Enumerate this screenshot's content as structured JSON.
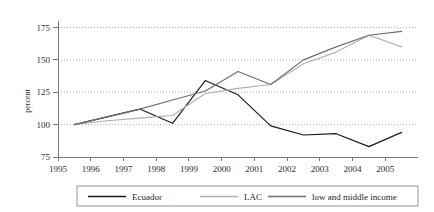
{
  "chart_data": {
    "type": "line",
    "title": "",
    "subtitle": "",
    "xlabel": "",
    "ylabel": "percent",
    "xlim": [
      1995,
      2006
    ],
    "ylim": [
      75,
      180
    ],
    "yticks": [
      75,
      100,
      125,
      150,
      175
    ],
    "xticks": [
      1995,
      1996,
      1997,
      1998,
      1999,
      2000,
      2001,
      2002,
      2003,
      2004,
      2005
    ],
    "grid": "horizontal-dotted",
    "legend_position": "bottom",
    "x": [
      1995.5,
      1996.5,
      1997.5,
      1998.5,
      1999.5,
      2000.5,
      2001.5,
      2002.5,
      2003.5,
      2004.5,
      2005.5
    ],
    "series": [
      {
        "name": "Ecuador",
        "color": "#1a1a1a",
        "values": [
          100,
          106,
          112,
          101,
          134,
          123,
          99,
          92,
          93,
          83,
          94
        ]
      },
      {
        "name": "LAC",
        "color": "#b0b0b0",
        "values": [
          100,
          103,
          105,
          107,
          124,
          128,
          131,
          147,
          156,
          169,
          160
        ]
      },
      {
        "name": "low and middle income",
        "color": "#6e6e6e",
        "values": [
          100,
          106,
          112,
          119,
          126,
          141,
          131,
          150,
          160,
          169,
          172
        ]
      }
    ]
  },
  "legend": {
    "items": [
      {
        "label": "Ecuador"
      },
      {
        "label": "LAC"
      },
      {
        "label": "low and middle income"
      }
    ]
  },
  "axes": {
    "y_title": "percent",
    "y_tick_labels": [
      "175",
      "150",
      "125",
      "100",
      "75"
    ],
    "x_tick_labels": [
      "1995",
      "1996",
      "1997",
      "1998",
      "1999",
      "2000",
      "2001",
      "2002",
      "2003",
      "2004",
      "2005"
    ]
  }
}
